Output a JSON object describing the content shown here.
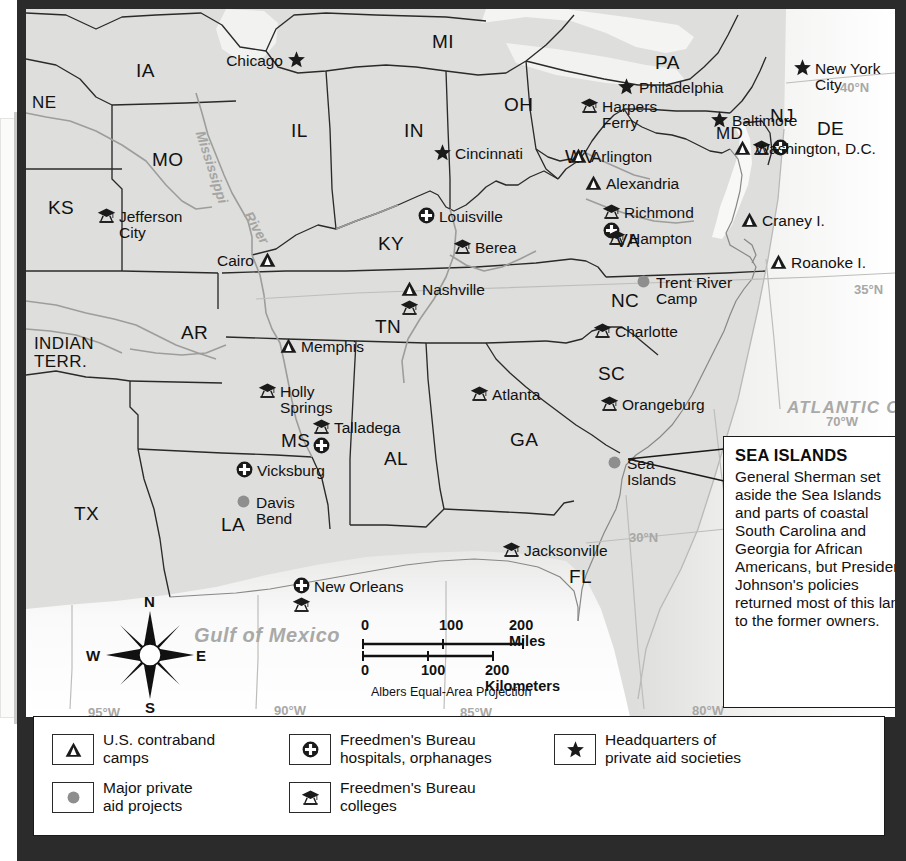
{
  "map": {
    "title": "Freedmen's Bureau and Aid Societies in the Reconstruction South",
    "background_color": "#dededc",
    "frame_color": "#2b2b2b",
    "states": [
      {
        "label": "NE",
        "x": 6,
        "y": 85,
        "size": "small"
      },
      {
        "label": "IA",
        "x": 110,
        "y": 52,
        "size": "normal"
      },
      {
        "label": "IL",
        "x": 265,
        "y": 112,
        "size": "normal"
      },
      {
        "label": "IN",
        "x": 378,
        "y": 112,
        "size": "normal"
      },
      {
        "label": "MI",
        "x": 406,
        "y": 23,
        "size": "normal"
      },
      {
        "label": "OH",
        "x": 478,
        "y": 86,
        "size": "normal"
      },
      {
        "label": "PA",
        "x": 629,
        "y": 44,
        "size": "normal"
      },
      {
        "label": "NJ",
        "x": 744,
        "y": 97,
        "size": "normal"
      },
      {
        "label": "DE",
        "x": 791,
        "y": 110,
        "size": "normal"
      },
      {
        "label": "MD",
        "x": 690,
        "y": 116,
        "size": "small"
      },
      {
        "label": "MO",
        "x": 126,
        "y": 141,
        "size": "normal"
      },
      {
        "label": "KS",
        "x": 22,
        "y": 189,
        "size": "normal"
      },
      {
        "label": "KY",
        "x": 352,
        "y": 225,
        "size": "normal"
      },
      {
        "label": "WV",
        "x": 539,
        "y": 138,
        "size": "normal"
      },
      {
        "label": "VA",
        "x": 589,
        "y": 222,
        "size": "normal"
      },
      {
        "label": "AR",
        "x": 155,
        "y": 314,
        "size": "normal"
      },
      {
        "label": "TN",
        "x": 349,
        "y": 308,
        "size": "normal"
      },
      {
        "label": "NC",
        "x": 585,
        "y": 282,
        "size": "normal"
      },
      {
        "label": "SC",
        "x": 572,
        "y": 355,
        "size": "normal"
      },
      {
        "label": "MS",
        "x": 255,
        "y": 422,
        "size": "normal"
      },
      {
        "label": "AL",
        "x": 358,
        "y": 440,
        "size": "normal"
      },
      {
        "label": "GA",
        "x": 484,
        "y": 421,
        "size": "normal"
      },
      {
        "label": "LA",
        "x": 195,
        "y": 506,
        "size": "normal"
      },
      {
        "label": "TX",
        "x": 48,
        "y": 495,
        "size": "normal"
      },
      {
        "label": "FL",
        "x": 543,
        "y": 558,
        "size": "normal"
      },
      {
        "label": "INDIAN\nTERR.",
        "x": 8,
        "y": 326,
        "size": "small"
      }
    ],
    "cities": [
      {
        "label": "Chicago",
        "x": 257,
        "y": 44,
        "align": "right",
        "symbols": [
          "star"
        ]
      },
      {
        "label": "Cincinnati",
        "x": 429,
        "y": 137,
        "align": "left",
        "symbols": [
          "star"
        ]
      },
      {
        "label": "New York\nCity",
        "x": 789,
        "y": 52,
        "align": "left",
        "symbols": [
          "star"
        ]
      },
      {
        "label": "Philadelphia",
        "x": 613,
        "y": 71,
        "align": "left",
        "symbols": [
          "star"
        ]
      },
      {
        "label": "Baltimore",
        "x": 706,
        "y": 104,
        "align": "left",
        "symbols": [
          "star"
        ]
      },
      {
        "label": "Harpers\nFerry",
        "x": 576,
        "y": 90,
        "align": "left",
        "symbols": [
          "college"
        ]
      },
      {
        "label": "Washington, D.C.",
        "x": 729,
        "y": 132,
        "align": "left",
        "symbols": [
          "camp",
          "college",
          "hospital"
        ]
      },
      {
        "label": "Arlington",
        "x": 565,
        "y": 140,
        "align": "left",
        "symbols": [
          "camp"
        ]
      },
      {
        "label": "Alexandria",
        "x": 580,
        "y": 167,
        "align": "left",
        "symbols": [
          "camp"
        ]
      },
      {
        "label": "Richmond",
        "x": 598,
        "y": 196,
        "align": "left",
        "symbols": [
          "college",
          "hospital"
        ]
      },
      {
        "label": "Hampton",
        "x": 603,
        "y": 222,
        "align": "left",
        "symbols": [
          "college"
        ]
      },
      {
        "label": "Craney I.",
        "x": 736,
        "y": 204,
        "align": "left",
        "symbols": [
          "camp"
        ]
      },
      {
        "label": "Roanoke I.",
        "x": 765,
        "y": 246,
        "align": "left",
        "symbols": [
          "camp"
        ]
      },
      {
        "label": "Trent River\nCamp",
        "x": 630,
        "y": 266,
        "align": "left",
        "symbols": [
          "dot"
        ]
      },
      {
        "label": "Jefferson\nCity",
        "x": 93,
        "y": 200,
        "align": "left",
        "symbols": [
          "college"
        ]
      },
      {
        "label": "Louisville",
        "x": 413,
        "y": 200,
        "align": "left",
        "symbols": [
          "hospital"
        ]
      },
      {
        "label": "Berea",
        "x": 449,
        "y": 231,
        "align": "left",
        "symbols": [
          "college"
        ]
      },
      {
        "label": "Cairo",
        "x": 228,
        "y": 244,
        "align": "right",
        "symbols": [
          "camp"
        ]
      },
      {
        "label": "Nashville",
        "x": 396,
        "y": 273,
        "align": "left",
        "symbols": [
          "camp",
          "college"
        ]
      },
      {
        "label": "Charlotte",
        "x": 589,
        "y": 315,
        "align": "left",
        "symbols": [
          "college"
        ]
      },
      {
        "label": "Memphis",
        "x": 275,
        "y": 330,
        "align": "left",
        "symbols": [
          "camp"
        ]
      },
      {
        "label": "Holly\nSprings",
        "x": 254,
        "y": 375,
        "align": "left",
        "symbols": [
          "college"
        ]
      },
      {
        "label": "Atlanta",
        "x": 466,
        "y": 378,
        "align": "left",
        "symbols": [
          "college"
        ]
      },
      {
        "label": "Orangeburg",
        "x": 596,
        "y": 388,
        "align": "left",
        "symbols": [
          "college"
        ]
      },
      {
        "label": "Talladega",
        "x": 308,
        "y": 411,
        "align": "left",
        "symbols": [
          "college",
          "hospital"
        ]
      },
      {
        "label": "Sea\nIslands",
        "x": 601,
        "y": 447,
        "align": "left",
        "symbols": [
          "dot"
        ]
      },
      {
        "label": "Vicksburg",
        "x": 231,
        "y": 454,
        "align": "left",
        "symbols": [
          "hospital"
        ]
      },
      {
        "label": "Davis\nBend",
        "x": 230,
        "y": 486,
        "align": "left",
        "symbols": [
          "dot"
        ]
      },
      {
        "label": "Jacksonville",
        "x": 498,
        "y": 534,
        "align": "left",
        "symbols": [
          "college"
        ]
      },
      {
        "label": "New Orleans",
        "x": 288,
        "y": 570,
        "align": "left",
        "symbols": [
          "hospital",
          "college"
        ]
      }
    ],
    "water_labels": [
      {
        "label": "ATLANTIC OCEAN",
        "x": 761,
        "y": 390,
        "kind": "ocean"
      },
      {
        "label": "Gulf of Mexico",
        "x": 168,
        "y": 616,
        "kind": "gulf"
      },
      {
        "label": "Mississippi",
        "x": 181,
        "y": 120,
        "kind": "river",
        "rotate": 72
      },
      {
        "label": "River",
        "x": 228,
        "y": 200,
        "kind": "river",
        "rotate": 60
      }
    ],
    "graticule_labels": [
      {
        "label": "40°N",
        "x": 814,
        "y": 72
      },
      {
        "label": "35°N",
        "x": 828,
        "y": 274
      },
      {
        "label": "30°N",
        "x": 603,
        "y": 522
      },
      {
        "label": "70°W",
        "x": 800,
        "y": 406
      },
      {
        "label": "80°W",
        "x": 666,
        "y": 695
      },
      {
        "label": "85°W",
        "x": 434,
        "y": 697
      },
      {
        "label": "90°W",
        "x": 248,
        "y": 695
      },
      {
        "label": "95°W",
        "x": 62,
        "y": 697
      }
    ]
  },
  "compass": {
    "north": "N",
    "east": "E",
    "south": "S",
    "west": "W"
  },
  "scale": {
    "miles_ticks": [
      "0",
      "100",
      "200 Miles"
    ],
    "km_ticks": [
      "0",
      "100",
      "200 Kilometers"
    ],
    "projection": "Albers Equal-Area Projection"
  },
  "callout": {
    "title": "SEA ISLANDS",
    "body": "General Sherman set aside the Sea Islands and parts of coastal South Carolina and Georgia for African Americans, but President Johnson's policies returned most of this land to the former owners."
  },
  "legend": {
    "items": [
      {
        "icon": "camp-icon",
        "label": "U.S. contraband\ncamps"
      },
      {
        "icon": "dot-icon",
        "label": "Major private\naid projects"
      },
      {
        "icon": "hospital-icon",
        "label": "Freedmen's Bureau\nhospitals, orphanages"
      },
      {
        "icon": "college-icon",
        "label": "Freedmen's Bureau\ncolleges"
      },
      {
        "icon": "star-icon",
        "label": "Headquarters of\nprivate aid societies"
      }
    ]
  },
  "colors": {
    "land": "#dededc",
    "water": "#ffffff",
    "border": "#2b2b2b",
    "symbol": "#1a1a1a",
    "graticule": "#b6b6b4",
    "dot": "#8e8e8e"
  }
}
